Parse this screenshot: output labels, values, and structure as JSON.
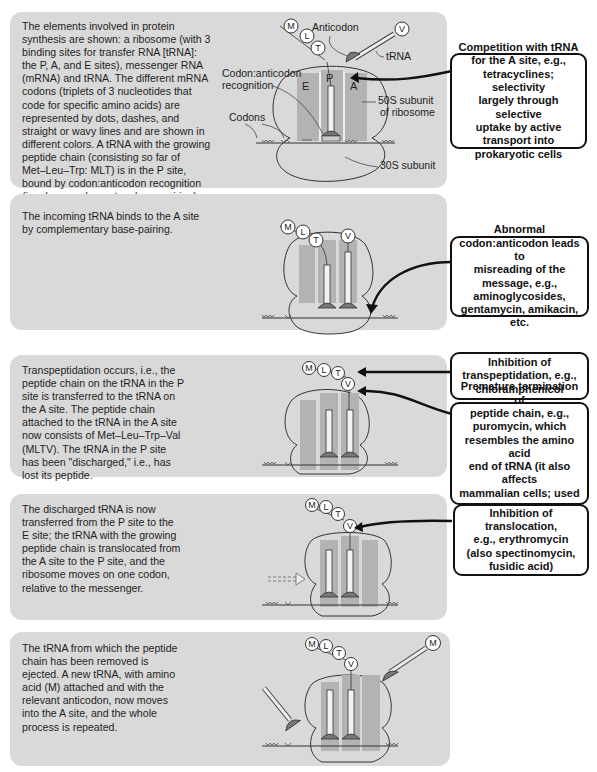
{
  "panels": [
    {
      "step": 1,
      "description": "The elements involved in protein\nsynthesis are shown: a ribosome (with 3\nbinding sites for transfer RNA [tRNA]:\nthe P, A, and E sites), messenger RNA\n(mRNA) and tRNA. The different mRNA\ncodons (triplets of 3 nucleotides that\ncode for specific amino acids) are\nrepresented by dots, dashes, and\nstraight or wavy lines and are shown in\ndifferent colors. A tRNA with the growing\npeptide chain (consisting so far of\nMet–Leu–Trp: MLT) is in the P site,\nbound by codon:anticodon recognition\n(i.e., by complementary base-pairing).\nThe incoming tRNA carries valine (V),\ncovalently linked.",
      "labels": {
        "anticodon": "Anticodon",
        "trna": "tRNA",
        "codon_anticodon": "Codon:anticodon\nrecognition",
        "codons": "Codons",
        "subunit_50s": "50S subunit\nof ribosome",
        "subunit_30s": "30S subunit",
        "site_e": "E",
        "site_p": "P",
        "site_a": "A"
      },
      "peptide_chain": [
        "M",
        "L",
        "T"
      ],
      "incoming_amino_acid": "V"
    },
    {
      "step": 2,
      "description": "The incoming tRNA binds to the A site\nby complementary base-pairing.",
      "peptide_chain": [
        "M",
        "L",
        "T"
      ],
      "incoming_amino_acid": "V"
    },
    {
      "step": 3,
      "description": "Transpeptidation occurs, i.e., the\npeptide chain on the tRNA in the P\nsite is transferred to the tRNA on\nthe A site. The peptide chain\nattached to the tRNA in the A site\nnow consists of Met–Leu–Trp–Val\n(MLTV). The tRNA in the P site\nhas been \"discharged,\" i.e., has\nlost its peptide.",
      "peptide_chain": [
        "M",
        "L",
        "T",
        "V"
      ]
    },
    {
      "step": 4,
      "description": "The discharged tRNA is now\ntransferred from the P site to the\nE site; the tRNA with the growing\npeptide chain is translocated from\nthe A site to the P site, and the\nribosome moves on one codon,\nrelative to the messenger.",
      "peptide_chain": [
        "M",
        "L",
        "T",
        "V"
      ]
    },
    {
      "step": 5,
      "description": "The tRNA from which the peptide\nchain has been removed is\nejected.  A new tRNA, with amino\nacid (M) attached and with the\nrelevant anticodon, now moves\ninto the A site, and the whole\nprocess is repeated.",
      "peptide_chain": [
        "M",
        "L",
        "T",
        "V"
      ],
      "incoming_amino_acid": "M"
    }
  ],
  "callouts": [
    {
      "id": "a-site-competition",
      "text": "Competition with tRNA\nfor the A site, e.g.,\ntetracyclines; selectivity\nlargely through selective\nuptake by active\ntransport into\nprokaryotic cells"
    },
    {
      "id": "misreading",
      "text": "Abnormal\ncodon:anticodon leads to\nmisreading of the\nmessage, e.g.,\naminoglycosides,\ngentamycin, amikacin, etc."
    },
    {
      "id": "transpeptidation-inhibition",
      "text": "Inhibition of\ntranspeptidation, e.g.,\nchloramphenicol"
    },
    {
      "id": "premature-termination",
      "text": "Premature termination of\npeptide chain, e.g.,\npuromycin, which\nresembles the amino acid\nend of tRNA (it also affects\nmammalian cells; used as\nan experimental tool)"
    },
    {
      "id": "translocation-inhibition",
      "text": "Inhibition of\ntranslocation,\ne.g., erythromycin\n(also spectinomycin,\nfusidic acid)"
    }
  ],
  "colors": {
    "panel_bg": "#d9d9d9",
    "site_shade": "#b3b3b3",
    "outline": "#333333",
    "callout_border": "#111111"
  }
}
